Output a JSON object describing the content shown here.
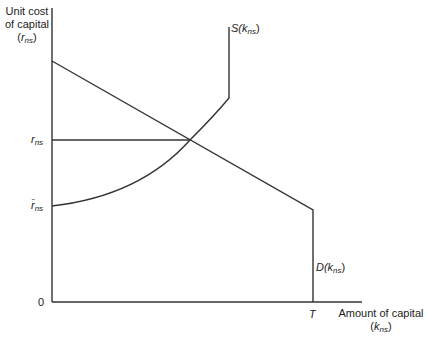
{
  "diagram": {
    "y_axis": {
      "title_line1": "Unit cost",
      "title_line2": "of capital",
      "title_var": "r",
      "title_var_sub": "ns"
    },
    "x_axis": {
      "title_line1": "Amount of capital",
      "title_var": "k",
      "title_var_sub": "ns"
    },
    "ticks": {
      "y_r_ns": {
        "base": "r",
        "sub": "ns"
      },
      "y_rbar_ns": {
        "base": "r̄",
        "sub": "ns"
      },
      "origin": "0",
      "x_T": "T"
    },
    "curves": {
      "supply": {
        "label_prefix": "S(",
        "var": "k",
        "sub": "ns",
        "suffix": ")"
      },
      "demand": {
        "label_prefix": "D(",
        "var": "k",
        "sub": "ns",
        "suffix": ")"
      }
    },
    "colors": {
      "line": "#333333",
      "text": "#222222"
    }
  }
}
